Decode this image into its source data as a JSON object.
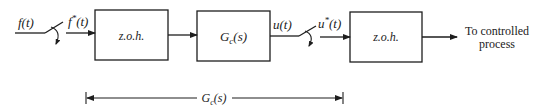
{
  "diagram": {
    "input_signal": "f(t)",
    "sampled_input_main": "f",
    "sampled_input_sup": "*",
    "sampled_input_arg": "(t)",
    "block1": {
      "label": "z.o.h."
    },
    "block2": {
      "label_main": "G",
      "label_sub": "c",
      "label_arg": "(s)"
    },
    "controller_output": "u(t)",
    "sampled_output_main": "u",
    "sampled_output_sup": "*",
    "sampled_output_arg": "(t)",
    "block3": {
      "label": "z.o.h."
    },
    "output_text_line1": "To controlled",
    "output_text_line2": "process",
    "span": {
      "label_main": "G",
      "label_sub": "c",
      "label_arg": "(s)"
    }
  },
  "colors": {
    "line": "#1e1e1e",
    "text": "#222222",
    "background": "#ffffff"
  }
}
